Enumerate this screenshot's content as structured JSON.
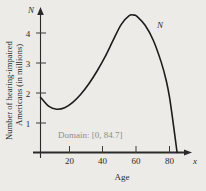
{
  "chart_data": {
    "type": "line",
    "title": "",
    "xlabel": "Age",
    "ylabel_line1": "Number of hearing-impaired",
    "ylabel_line2": "Americans (in millions)",
    "x_axis_symbol": "x",
    "y_axis_symbol": "N",
    "curve_label": "N",
    "annotation": "Domain: [0, 84.7]",
    "xlim": [
      0,
      90
    ],
    "ylim": [
      0,
      5
    ],
    "xticks": [
      20,
      40,
      60,
      80
    ],
    "yticks": [
      1,
      2,
      3,
      4
    ],
    "xtick_labels": [
      "20",
      "40",
      "60",
      "80"
    ],
    "ytick_labels": [
      "1",
      "2",
      "3",
      "4"
    ],
    "grid": false,
    "legend": "none",
    "series": [
      {
        "name": "N",
        "x": [
          0,
          5,
          10,
          15,
          20,
          25,
          30,
          35,
          40,
          45,
          50,
          55,
          58,
          60,
          65,
          70,
          75,
          78,
          80,
          82,
          84.7
        ],
        "y": [
          1.85,
          1.55,
          1.45,
          1.5,
          1.68,
          1.95,
          2.3,
          2.72,
          3.2,
          3.75,
          4.28,
          4.58,
          4.6,
          4.55,
          4.25,
          3.75,
          3.0,
          2.4,
          1.85,
          1.1,
          0.0
        ]
      }
    ]
  },
  "figure": {
    "background_color": "#ecebe8",
    "curve_color": "#1d1d1d",
    "axis_color": "#2a2a2a",
    "annotation_color": "#8e8d8a"
  }
}
